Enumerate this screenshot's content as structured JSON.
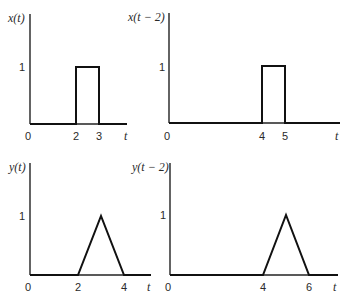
{
  "panels": [
    {
      "id": "x",
      "ylabel": "x(t)",
      "one_label": "1",
      "origin_label": "0",
      "xaxis_label": "t",
      "tick_labels": [
        "2",
        "3"
      ],
      "shape": "rectangular pulse",
      "breakpoints": [
        [
          0,
          0
        ],
        [
          2,
          0
        ],
        [
          2,
          1
        ],
        [
          3,
          1
        ],
        [
          3,
          0
        ],
        [
          4.5,
          0
        ]
      ]
    },
    {
      "id": "x_shift",
      "ylabel": "x(t − 2)",
      "one_label": "1",
      "origin_label": "0",
      "xaxis_label": "t",
      "tick_labels": [
        "4",
        "5"
      ],
      "shape": "rectangular pulse",
      "breakpoints": [
        [
          0,
          0
        ],
        [
          4,
          0
        ],
        [
          4,
          1
        ],
        [
          5,
          1
        ],
        [
          5,
          0
        ],
        [
          7.5,
          0
        ]
      ]
    },
    {
      "id": "y",
      "ylabel": "y(t)",
      "one_label": "1",
      "origin_label": "0",
      "xaxis_label": "t",
      "tick_labels": [
        "2",
        "4"
      ],
      "shape": "triangular pulse",
      "breakpoints": [
        [
          0,
          0
        ],
        [
          2,
          0
        ],
        [
          3,
          1
        ],
        [
          4,
          0
        ],
        [
          4.5,
          0
        ]
      ]
    },
    {
      "id": "y_shift",
      "ylabel": "y(t − 2)",
      "one_label": "1",
      "origin_label": "0",
      "xaxis_label": "t",
      "tick_labels": [
        "4",
        "6"
      ],
      "shape": "triangular pulse",
      "breakpoints": [
        [
          0,
          0
        ],
        [
          4,
          0
        ],
        [
          5,
          1
        ],
        [
          6,
          0
        ],
        [
          7.5,
          0
        ]
      ]
    }
  ]
}
